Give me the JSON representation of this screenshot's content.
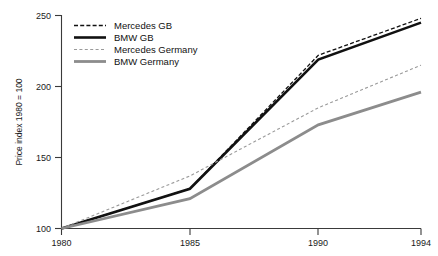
{
  "chart_data": {
    "type": "line",
    "title": "",
    "xlabel": "",
    "ylabel": "Price index 1980 = 100",
    "x": [
      1980,
      1985,
      1990,
      1994
    ],
    "xtick_labels": [
      "1980",
      "1985",
      "1990",
      "1994"
    ],
    "ytick_labels": [
      "100",
      "150",
      "200",
      "250"
    ],
    "yticks": [
      100,
      150,
      200,
      250
    ],
    "xlim": [
      1980,
      1994
    ],
    "ylim": [
      100,
      250
    ],
    "grid": false,
    "legend_position": "top-left-inside",
    "series": [
      {
        "name": "Mercedes GB",
        "values": [
          100,
          128,
          222,
          248
        ],
        "color": "#111111",
        "style": "dashed",
        "width": 1.3,
        "dash": "4,2.2"
      },
      {
        "name": "BMW GB",
        "values": [
          100,
          128,
          219,
          245
        ],
        "color": "#111111",
        "style": "solid",
        "width": 2.6,
        "dash": "none"
      },
      {
        "name": "Mercedes Germany",
        "values": [
          100,
          137,
          185,
          215
        ],
        "color": "#9a9a9a",
        "style": "dashed",
        "width": 1.1,
        "dash": "3,2.4"
      },
      {
        "name": "BMW Germany",
        "values": [
          100,
          121,
          173,
          196
        ],
        "color": "#8c8c8c",
        "style": "solid",
        "width": 2.8,
        "dash": "none"
      }
    ]
  },
  "legend": {
    "entries": [
      {
        "label": "Mercedes GB"
      },
      {
        "label": "BMW GB"
      },
      {
        "label": "Mercedes Germany"
      },
      {
        "label": "BMW Germany"
      }
    ]
  },
  "axes": {
    "y_title": "Price index 1980 = 100",
    "y_tick_0": "100",
    "y_tick_1": "150",
    "y_tick_2": "200",
    "y_tick_3": "250",
    "x_tick_0": "1980",
    "x_tick_1": "1985",
    "x_tick_2": "1990",
    "x_tick_3": "1994"
  }
}
